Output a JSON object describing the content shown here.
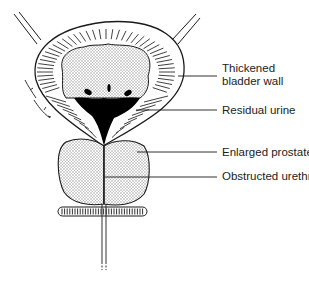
{
  "diagram": {
    "labels": [
      {
        "id": "thickened-bladder-wall",
        "lines": [
          "Thickened",
          "bladder wall"
        ],
        "y": 62
      },
      {
        "id": "residual-urine",
        "lines": [
          "Residual urine"
        ],
        "y": 106
      },
      {
        "id": "enlarged-prostate",
        "lines": [
          "Enlarged prostate"
        ],
        "y": 147
      },
      {
        "id": "obstructed-urethra",
        "lines": [
          "Obstructed urethra"
        ],
        "y": 171
      }
    ],
    "colors": {
      "line": "#1a1a1a",
      "stipple": "#bdbdbd",
      "urine": "#000000",
      "background": "#ffffff"
    }
  }
}
